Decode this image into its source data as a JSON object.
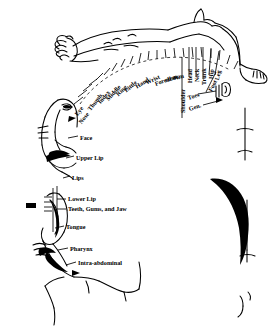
{
  "diagram": {
    "colors": {
      "ink": "#000000",
      "background": "#ffffff"
    },
    "radial_labels": [
      {
        "text": "Eye",
        "x": 76,
        "y": 112,
        "rot": -52,
        "style": "b"
      },
      {
        "text": "Nose",
        "x": 80,
        "y": 120,
        "rot": -52,
        "style": "b"
      },
      {
        "text": "Thumb",
        "x": 89,
        "y": 107,
        "rot": -52,
        "style": "b"
      },
      {
        "text": "Index",
        "x": 99,
        "y": 100,
        "rot": -50,
        "style": "b"
      },
      {
        "text": "Middle",
        "x": 107,
        "y": 97,
        "rot": -48,
        "style": "b"
      },
      {
        "text": "Ring",
        "x": 117,
        "y": 92,
        "rot": -44,
        "style": "b"
      },
      {
        "text": "Little",
        "x": 125,
        "y": 88,
        "rot": -40,
        "style": "b"
      },
      {
        "text": "Hand",
        "x": 136,
        "y": 84,
        "rot": -33,
        "style": "b"
      },
      {
        "text": "Wrist",
        "x": 146,
        "y": 80,
        "rot": -26,
        "style": "b"
      },
      {
        "text": "Forearm",
        "x": 155,
        "y": 81,
        "rot": -20,
        "style": "b"
      },
      {
        "text": "elbow",
        "x": 165,
        "y": 77,
        "rot": -12,
        "style": "b"
      },
      {
        "text": "arm",
        "x": 173,
        "y": 74,
        "rot": -6,
        "style": "b"
      },
      {
        "text": "Shoulder",
        "x": 183,
        "y": 110,
        "rot": -90,
        "style": "b"
      },
      {
        "text": "Head",
        "x": 190,
        "y": 80,
        "rot": -90,
        "style": "b"
      },
      {
        "text": "Neck",
        "x": 197,
        "y": 79,
        "rot": -90,
        "style": "b"
      },
      {
        "text": "Trunk",
        "x": 204,
        "y": 82,
        "rot": -90,
        "style": "b"
      },
      {
        "text": "Hip",
        "x": 211,
        "y": 76,
        "rot": -85,
        "style": "b"
      },
      {
        "text": "Leg",
        "x": 217,
        "y": 77,
        "rot": -78,
        "style": "b"
      },
      {
        "text": "Foot",
        "x": 210,
        "y": 88,
        "rot": -62,
        "style": "b"
      },
      {
        "text": "Toes",
        "x": 188,
        "y": 95,
        "rot": -18,
        "style": "b"
      },
      {
        "text": "Gen.",
        "x": 189,
        "y": 106,
        "rot": -18,
        "style": "b"
      }
    ],
    "side_labels": [
      {
        "text": "Face",
        "x": 80,
        "y": 135,
        "style": "b"
      },
      {
        "text": "Upper Lip",
        "x": 76,
        "y": 155,
        "style": "b"
      },
      {
        "text": "Lips",
        "x": 72,
        "y": 175,
        "style": "b"
      },
      {
        "text": "Lower Lip",
        "x": 68,
        "y": 198,
        "style": "b"
      },
      {
        "text": "Teeth, Gums, and Jaw",
        "x": 68,
        "y": 208,
        "style": "b"
      },
      {
        "text": "Tongue",
        "x": 66,
        "y": 225,
        "style": "b"
      },
      {
        "text": "Pharynx",
        "x": 70,
        "y": 247,
        "style": "b"
      },
      {
        "text": "Intra-abdominal",
        "x": 78,
        "y": 261,
        "style": "b"
      }
    ]
  }
}
